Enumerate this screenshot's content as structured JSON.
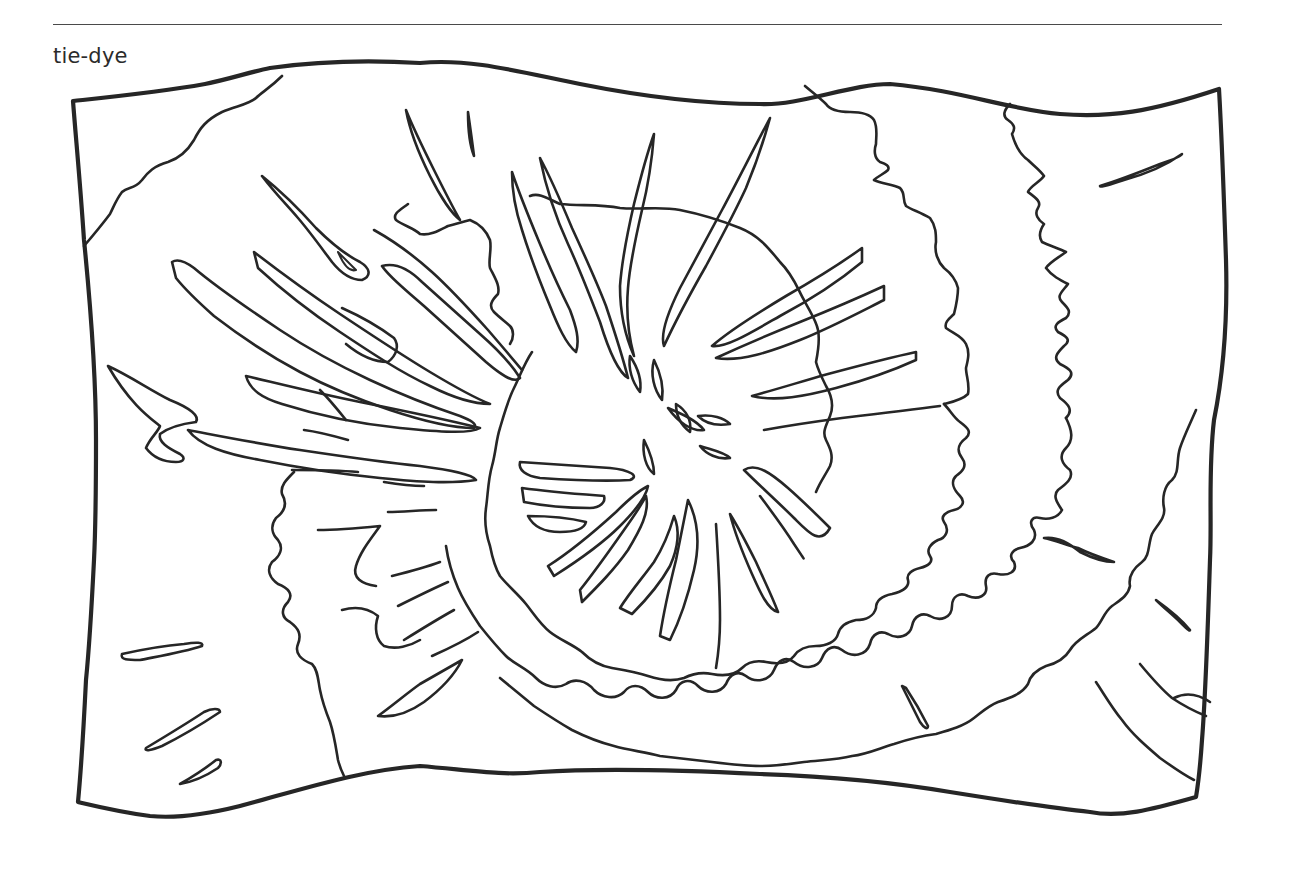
{
  "page": {
    "title": "tie-dye"
  },
  "illustration": {
    "subject": "tie-dye-cloth",
    "style": "black line-art coloring page",
    "stroke_color": "#262626",
    "background_color": "#ffffff"
  }
}
